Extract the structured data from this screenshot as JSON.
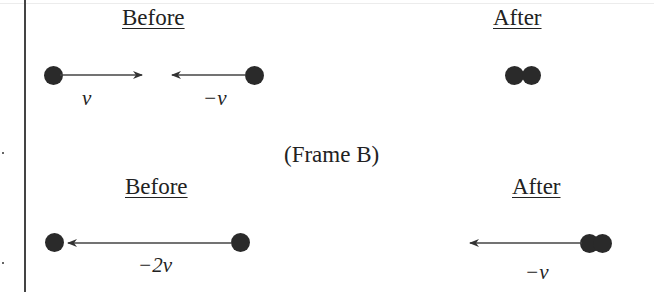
{
  "diagram": {
    "frame_label": "(Frame B)",
    "row1": {
      "before": {
        "heading": "Before",
        "left_ball_velocity": "v",
        "right_ball_velocity": "−v"
      },
      "after": {
        "heading": "After"
      }
    },
    "row2": {
      "before": {
        "heading": "Before",
        "velocity": "−2v"
      },
      "after": {
        "heading": "After",
        "velocity": "−v"
      }
    }
  },
  "colors": {
    "ball": "#2a2a2a",
    "line": "#444444",
    "text": "#222222"
  }
}
